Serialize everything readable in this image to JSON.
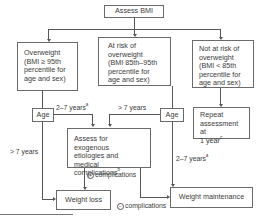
{
  "diagram": {
    "type": "flowchart",
    "nodes": {
      "assess_bmi": "Assess BMI",
      "overweight": [
        "Overweight",
        "(BMI ≥ 95th",
        "percentile for",
        "age and sex)"
      ],
      "at_risk": [
        "At risk of",
        "overweight",
        "(BMI 85th–95th",
        "percentile for",
        "age and sex)"
      ],
      "not_at_risk": [
        "Not at risk of",
        "overweight",
        "(BMI < 85th",
        "percentile for",
        "age and sex)"
      ],
      "age_left": "Age",
      "age_middle": "Age",
      "repeat": [
        "Repeat",
        "assessment at",
        "1 year"
      ],
      "repeat_sup": "c",
      "assess_exogenous": [
        "Assess for exogenous",
        "etiologies and medical",
        "complications"
      ],
      "assess_exogenous_sup": "b",
      "weight_loss": "Weight loss",
      "weight_maintenance": "Weight maintenance"
    },
    "edge_labels": {
      "left_2_7": "2–7 years",
      "left_2_7_sup": "a",
      "left_gt7": "> 7 years",
      "mid_gt7": "> 7 years",
      "mid_2_7": "2–7 years",
      "mid_2_7_sup": "a",
      "plus_complications": "complications",
      "plus_symbol": "+",
      "minus_complications": "complications",
      "minus_symbol": "−"
    }
  }
}
